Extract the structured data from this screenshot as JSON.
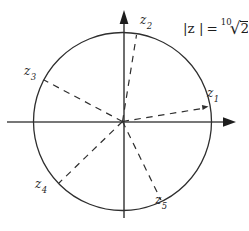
{
  "figure": {
    "modulus": {
      "lhs": "|z |",
      "equals": "=",
      "index": "10",
      "radical_sign": "√",
      "radicand": "2"
    },
    "labels": {
      "z1": {
        "base": "z",
        "sub": "1"
      },
      "z2": {
        "base": "z",
        "sub": "2"
      },
      "z3": {
        "base": "z",
        "sub": "3"
      },
      "z4": {
        "base": "z",
        "sub": "4"
      },
      "z5": {
        "base": "z",
        "sub": "5"
      }
    }
  }
}
